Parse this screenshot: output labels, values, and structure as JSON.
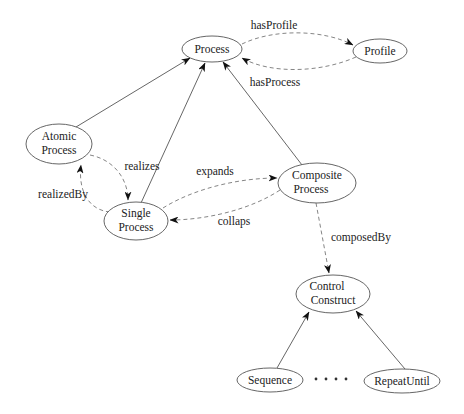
{
  "diagram": {
    "type": "ontology-class-diagram",
    "nodes": {
      "process": {
        "lines": [
          "Process"
        ],
        "cx": 212,
        "cy": 49,
        "rx": 30,
        "ry": 13
      },
      "profile": {
        "lines": [
          "Profile"
        ],
        "cx": 380,
        "cy": 51,
        "rx": 27,
        "ry": 12
      },
      "atomic_process": {
        "lines": [
          "Atomic",
          "Process"
        ],
        "cx": 59,
        "cy": 144,
        "rx": 33,
        "ry": 20
      },
      "single_process": {
        "lines": [
          "Single",
          "Process"
        ],
        "cx": 136,
        "cy": 221,
        "rx": 32,
        "ry": 19
      },
      "composite_process": {
        "lines": [
          "Composite",
          "Process"
        ],
        "cx": 317,
        "cy": 183,
        "rx": 39,
        "ry": 20
      },
      "control_construct": {
        "lines": [
          "Control",
          "Construct"
        ],
        "cx": 333,
        "cy": 294,
        "rx": 37,
        "ry": 19
      },
      "sequence": {
        "lines": [
          "Sequence"
        ],
        "cx": 270,
        "cy": 380,
        "rx": 33,
        "ry": 12
      },
      "repeat_until": {
        "lines": [
          "RepeatUntil"
        ],
        "cx": 402,
        "cy": 381,
        "rx": 38,
        "ry": 12
      }
    },
    "edges": {
      "atomic_to_process": {
        "from": "Atomic Process",
        "to": "Process",
        "style": "solid",
        "label": ""
      },
      "single_to_process": {
        "from": "Single Process",
        "to": "Process",
        "style": "solid",
        "label": ""
      },
      "composite_to_process": {
        "from": "Composite Process",
        "to": "Process",
        "style": "solid",
        "label": ""
      },
      "has_profile": {
        "from": "Process",
        "to": "Profile",
        "style": "dashed",
        "label": "hasProfile"
      },
      "has_process": {
        "from": "Profile",
        "to": "Process",
        "style": "dashed",
        "label": "hasProcess"
      },
      "realizes": {
        "from": "Atomic Process",
        "to": "Single Process",
        "style": "dashed",
        "label": "realizes"
      },
      "realized_by": {
        "from": "Single Process",
        "to": "Atomic Process",
        "style": "dashed",
        "label": "realizedBy"
      },
      "expands": {
        "from": "Single Process",
        "to": "Composite Process",
        "style": "dashed",
        "label": "expands"
      },
      "collaps": {
        "from": "Composite Process",
        "to": "Single Process",
        "style": "dashed",
        "label": "collaps"
      },
      "composed_by": {
        "from": "Composite Process",
        "to": "Control Construct",
        "style": "dashed",
        "label": "composedBy"
      },
      "sequence_to_cc": {
        "from": "Sequence",
        "to": "Control Construct",
        "style": "solid",
        "label": ""
      },
      "repeatuntil_to_cc": {
        "from": "RepeatUntil",
        "to": "Control Construct",
        "style": "solid",
        "label": ""
      }
    },
    "ellipsis": "• • • •"
  }
}
